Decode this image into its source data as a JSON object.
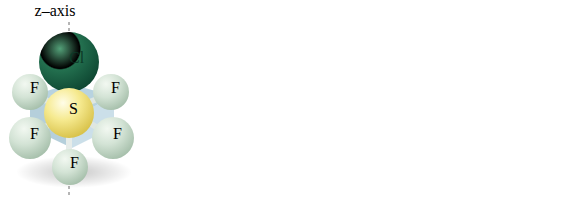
{
  "figure": {
    "type": "molecular-structure-diagram",
    "background_color": "#ffffff",
    "panel_count": 3
  },
  "colors": {
    "chlorine": "#1f6b4a",
    "chlorine_highlight": "#4e9b74",
    "chlorine_shadow": "#0e4730",
    "sulfur": "#f2e27a",
    "sulfur_highlight": "#fdf8c9",
    "sulfur_shadow": "#d8c24e",
    "fluorine": "#cfe0d2",
    "fluorine_highlight": "#eef5ee",
    "fluorine_shadow": "#a9c2ad",
    "plane": "#9dc2d4",
    "bond": "#e3e9e6",
    "axis_line": "#6d6d6d",
    "label_text": "#2b2b24"
  },
  "atom_labels": {
    "chlorine": "Cl",
    "sulfur": "S",
    "fluorine": "F"
  },
  "panels": [
    {
      "id": "panel-z",
      "name": "sf5cl-z-axis",
      "axis_label": "z–axis",
      "axis_letter": "z",
      "axis_suffix": "–axis",
      "chlorine_position": "top",
      "axis_line_orientation": "vertical",
      "atoms": [
        {
          "element": "Cl",
          "label": "Cl",
          "site": "axial-top"
        },
        {
          "element": "S",
          "label": "S",
          "site": "center"
        },
        {
          "element": "F",
          "label": "F",
          "site": "equatorial-upper-left"
        },
        {
          "element": "F",
          "label": "F",
          "site": "equatorial-upper-right"
        },
        {
          "element": "F",
          "label": "F",
          "site": "equatorial-lower-left"
        },
        {
          "element": "F",
          "label": "F",
          "site": "equatorial-lower-right"
        },
        {
          "element": "F",
          "label": "F",
          "site": "axial-bottom"
        }
      ]
    },
    {
      "id": "panel-x",
      "name": "sf5cl-x-axis",
      "axis_label": "x–axis",
      "axis_letter": "x",
      "axis_suffix": "–axis",
      "chlorine_position": "lower-right",
      "axis_line_orientation": "diagonal",
      "atoms": [
        {
          "element": "F",
          "label": "F",
          "site": "top"
        },
        {
          "element": "F",
          "label": "F",
          "site": "upper-left"
        },
        {
          "element": "F",
          "label": "F",
          "site": "upper-right"
        },
        {
          "element": "S",
          "label": "S",
          "site": "center"
        },
        {
          "element": "F",
          "label": "F",
          "site": "lower-left"
        },
        {
          "element": "F",
          "label": "F",
          "site": "bottom"
        },
        {
          "element": "Cl",
          "label": "Cl",
          "site": "lower-right"
        }
      ]
    },
    {
      "id": "panel-y",
      "name": "sf5cl-y-axis",
      "axis_label": "y–axis",
      "axis_letter": "y",
      "axis_suffix": "–axis",
      "chlorine_position": "left",
      "axis_line_orientation": "diagonal",
      "atoms": [
        {
          "element": "F",
          "label": "F",
          "site": "top"
        },
        {
          "element": "F",
          "label": "F",
          "site": "upper-left"
        },
        {
          "element": "F",
          "label": "F",
          "site": "upper-right"
        },
        {
          "element": "S",
          "label": "S",
          "site": "center"
        },
        {
          "element": "Cl",
          "label": "Cl",
          "site": "left"
        },
        {
          "element": "F",
          "label": "F",
          "site": "lower-right"
        },
        {
          "element": "F",
          "label": "F",
          "site": "bottom"
        }
      ]
    }
  ]
}
